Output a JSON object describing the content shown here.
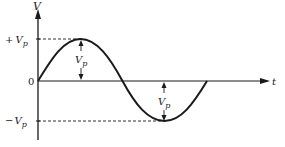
{
  "diagram": {
    "y_axis_label": "V",
    "x_axis_label": "t",
    "origin_label": "0",
    "positive_peak_label": {
      "sign": "+",
      "symbol": "V",
      "subscript": "p"
    },
    "negative_peak_label": {
      "sign": "−",
      "symbol": "V",
      "subscript": "p"
    },
    "amplitude_label_top": {
      "symbol": "V",
      "subscript": "p"
    },
    "amplitude_label_bottom": {
      "symbol": "V",
      "subscript": "p"
    },
    "curve": "one full sine cycle starting at origin",
    "colors": {
      "stroke": "#1a1a1a",
      "background": "#ffffff"
    }
  }
}
